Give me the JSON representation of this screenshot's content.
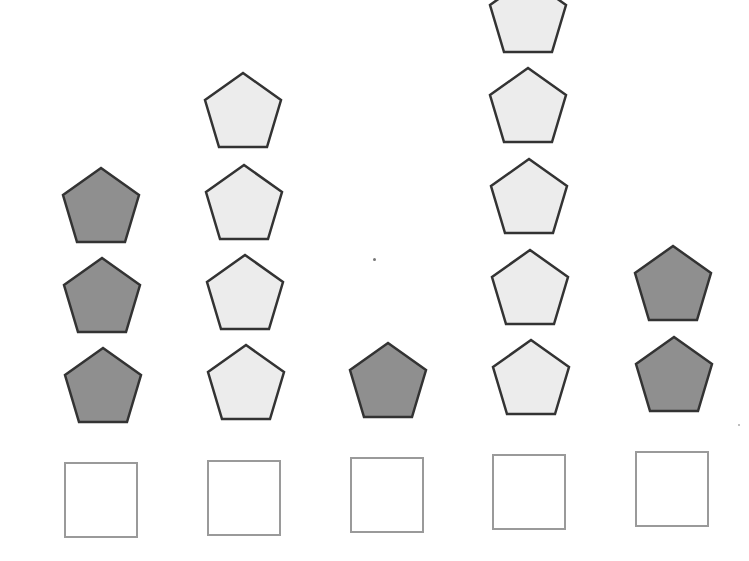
{
  "diagram": {
    "colors": {
      "dark_fill": "#8f8f8f",
      "light_fill": "#ececec",
      "outline": "#333333",
      "box_border": "#9a9a9a"
    },
    "columns": [
      {
        "index": 1,
        "count": 3,
        "shade": "dark",
        "center_x": 101
      },
      {
        "index": 2,
        "count": 4,
        "shade": "light",
        "center_x": 243
      },
      {
        "index": 3,
        "count": 1,
        "shade": "dark",
        "center_x": 386
      },
      {
        "index": 4,
        "count": 5,
        "shade": "light",
        "center_x": 528
      },
      {
        "index": 5,
        "count": 2,
        "shade": "dark",
        "center_x": 672
      }
    ],
    "answer_boxes": [
      {
        "column": 1,
        "value": ""
      },
      {
        "column": 2,
        "value": ""
      },
      {
        "column": 3,
        "value": ""
      },
      {
        "column": 4,
        "value": ""
      },
      {
        "column": 5,
        "value": ""
      }
    ]
  }
}
